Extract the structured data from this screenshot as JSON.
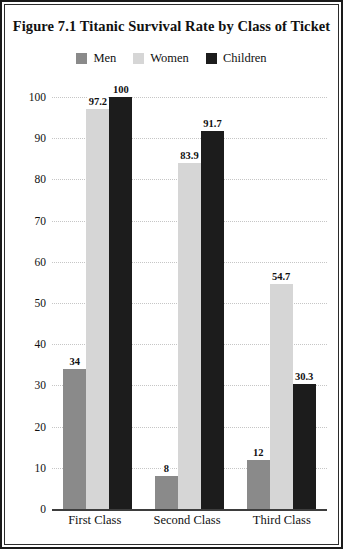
{
  "figure": {
    "title": "Figure 7.1  Titanic Survival Rate by Class of Ticket"
  },
  "chart_data": {
    "type": "bar",
    "title": "Figure 7.1  Titanic Survival Rate by Class of Ticket",
    "xlabel": "",
    "ylabel": "",
    "categories": [
      "First Class",
      "Second Class",
      "Third Class"
    ],
    "series": [
      {
        "name": "Men",
        "color": "#8a8a8a",
        "values": [
          34,
          8,
          12
        ],
        "labels": [
          "34",
          "8",
          "12"
        ]
      },
      {
        "name": "Women",
        "color": "#d6d6d6",
        "values": [
          97.2,
          83.9,
          54.7
        ],
        "labels": [
          "97.2",
          "83.9",
          "54.7"
        ]
      },
      {
        "name": "Children",
        "color": "#1c1c1c",
        "values": [
          100,
          91.7,
          30.3
        ],
        "labels": [
          "100",
          "91.7",
          "30.3"
        ]
      }
    ],
    "ylim": [
      0,
      100
    ],
    "yticks": [
      0,
      10,
      20,
      30,
      40,
      50,
      60,
      70,
      80,
      90,
      100
    ],
    "ytick_labels": [
      "0",
      "10",
      "20",
      "30",
      "40",
      "50",
      "60",
      "70",
      "80",
      "90",
      "100"
    ],
    "grid": true,
    "grid_style": "dotted",
    "legend_position": "top-center"
  },
  "colors": {
    "men": "#8a8a8a",
    "women": "#d6d6d6",
    "children": "#1c1c1c",
    "grid": "#c6c6c6",
    "axis": "#3d3d3d",
    "border": "#1a1a1a",
    "text": "#111111",
    "background": "#ffffff"
  }
}
